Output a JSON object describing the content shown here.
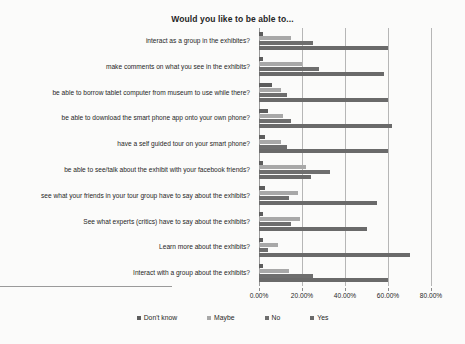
{
  "chart_data": {
    "type": "bar",
    "orientation": "horizontal",
    "title": "Would you like to be able to...",
    "xlabel": "",
    "ylabel": "",
    "xlim": [
      0,
      80
    ],
    "xticks": [
      "0.00%",
      "20.00%",
      "40.00%",
      "60.00%",
      "80.00%"
    ],
    "xtick_values": [
      0,
      20,
      40,
      60,
      80
    ],
    "grid": true,
    "legend_position": "bottom",
    "categories": [
      "interact as a group in the exhibites?",
      "make comments on what you see in the exhibits?",
      "be able to borrow tablet computer from museum to use while there?",
      "be able to download the smart phone app onto your own phone?",
      "have a self guided tour on your smart phone?",
      "be able to see/talk about the exhibit with your facebook friends?",
      "see what your friends in your tour group have to say about the exhibits?",
      "See what experts (critics) have to say about the exhibits?",
      "Learn more about the exhibits?",
      "Interact with a group about the exhibits?"
    ],
    "series": [
      {
        "name": "Don't know",
        "color": "#5d5d5d",
        "values": [
          2,
          2,
          6,
          4,
          3,
          2,
          3,
          2,
          2,
          2
        ]
      },
      {
        "name": "Maybe",
        "color": "#a8a8a8",
        "values": [
          15,
          20,
          10,
          11,
          10,
          22,
          18,
          19,
          9,
          14
        ]
      },
      {
        "name": "No",
        "color": "#6e6e6e",
        "values": [
          25,
          28,
          13,
          15,
          13,
          33,
          14,
          15,
          4,
          25
        ]
      },
      {
        "name": "Yes",
        "color": "#6a6a6a",
        "values": [
          60,
          58,
          60,
          62,
          60,
          24,
          55,
          50,
          70,
          60
        ]
      }
    ]
  },
  "legend": {
    "items": [
      {
        "label": "Don't know",
        "color": "#5d5d5d"
      },
      {
        "label": "Maybe",
        "color": "#a8a8a8"
      },
      {
        "label": "No",
        "color": "#6e6e6e"
      },
      {
        "label": "Yes",
        "color": "#6a6a6a"
      }
    ]
  }
}
